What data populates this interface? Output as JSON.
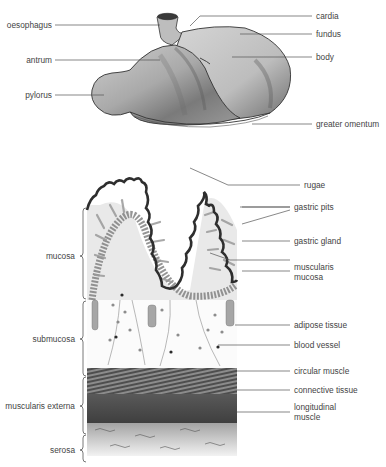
{
  "diagram": {
    "stomach_labels": {
      "oesophagus": "oesophagus",
      "antrum": "antrum",
      "pylorus": "pylorus",
      "cardia": "cardia",
      "fundus": "fundus",
      "body": "body",
      "greater_omentum": "greater omentum"
    },
    "wall_labels": {
      "rugae": "rugae",
      "gastric_pits": "gastric pits",
      "gastric_gland": "gastric gland",
      "muscularis_mucosa": "muscularis mucosa",
      "adipose_tissue": "adipose tissue",
      "blood_vessel": "blood vessel",
      "circular_muscle": "circular muscle",
      "connective_tissue": "connective tissue",
      "longitudinal_muscle": "longitudinal muscle"
    },
    "layer_labels": {
      "mucosa": "mucosa",
      "submucosa": "submucosa",
      "muscularis_externa": "muscularis externa",
      "serosa": "serosa"
    },
    "colors": {
      "line": "#555555",
      "tissue_dark": "#4a4a4a",
      "tissue_mid": "#8a8a8a",
      "tissue_light": "#cfcfcf"
    }
  }
}
